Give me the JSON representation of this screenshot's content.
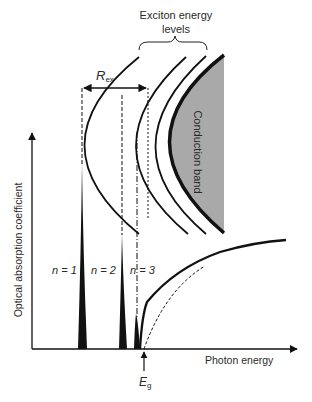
{
  "labels": {
    "exciton_title_line1": "Exciton energy",
    "exciton_title_line2": "levels",
    "rex_main": "R",
    "rex_sub": "ex",
    "conduction_band": "Conduction band",
    "y_axis": "Optical absorption coefficient",
    "x_axis": "Photon energy",
    "eg_main": "E",
    "eg_sub": "g",
    "n1": "n = 1",
    "n2": "n = 2",
    "n3": "n = 3"
  },
  "colors": {
    "ink": "#111111",
    "band_fill": "#a9a9a9",
    "text": "#2a2a2a"
  }
}
